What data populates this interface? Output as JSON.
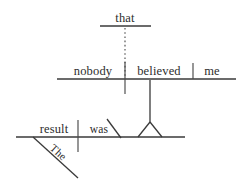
{
  "diagram": {
    "type": "reed-kellogg-sentence-diagram",
    "sentence": "The result was that nobody believed me.",
    "canvas": {
      "width": 239,
      "height": 185,
      "background": "#ffffff",
      "ink": "#2d2d2d"
    },
    "levels": {
      "subordinate_clause_top": {
        "name": "relative-marker-level",
        "baseline": {
          "x1": 100,
          "x2": 151,
          "y": 26
        },
        "words": [
          {
            "id": "that",
            "label": "that",
            "x": 125,
            "y": 22,
            "anchor": "middle",
            "role": "subordinating-conjunction"
          }
        ]
      },
      "subordinate_clause_main": {
        "name": "noun-clause-level",
        "baseline": {
          "x1": 57,
          "x2": 236,
          "y": 79
        },
        "words": [
          {
            "id": "nobody",
            "label": "nobody",
            "x": 93,
            "y": 75,
            "anchor": "middle",
            "role": "subject"
          },
          {
            "id": "believed",
            "label": "believed",
            "x": 159,
            "y": 75,
            "anchor": "middle",
            "role": "verb"
          },
          {
            "id": "me",
            "label": "me",
            "x": 211,
            "y": 75,
            "anchor": "middle",
            "role": "direct-object"
          }
        ],
        "dividers": [
          {
            "id": "subject-verb-divider",
            "x": 125,
            "y1": 62,
            "y2": 94,
            "kind": "full-cross"
          },
          {
            "id": "verb-object-divider",
            "x": 193,
            "y1": 63,
            "y2": 79,
            "kind": "half"
          }
        ]
      },
      "independent_clause": {
        "name": "main-clause-level",
        "baseline": {
          "x1": 16,
          "x2": 185,
          "y": 137
        },
        "words": [
          {
            "id": "result",
            "label": "result",
            "x": 54,
            "y": 133,
            "anchor": "middle",
            "role": "subject"
          },
          {
            "id": "was",
            "label": "was",
            "x": 98,
            "y": 133,
            "anchor": "middle",
            "role": "linking-verb"
          },
          {
            "id": "The",
            "label": "The",
            "x": 50,
            "y": 156,
            "anchor": "middle",
            "role": "article-modifier",
            "rotated": true,
            "rotation_deg": 42
          }
        ],
        "dividers": [
          {
            "id": "subject-verb-divider",
            "x": 78,
            "y1": 120,
            "y2": 152,
            "kind": "full-cross"
          }
        ],
        "modifier_lines": [
          {
            "id": "the-modifier-slant",
            "x1": 33,
            "y1": 137,
            "x2": 78,
            "y2": 178,
            "kind": "diagonal"
          }
        ],
        "complement_marker": {
          "id": "predicate-nominative-backslash",
          "x1": 107,
          "y1": 119,
          "x2": 121,
          "y2": 138,
          "kind": "backslash"
        }
      }
    },
    "connectors": [
      {
        "id": "dotted-relative-connector",
        "kind": "dotted-vertical",
        "from": "that-baseline",
        "to": "noun-clause-baseline",
        "x": 125,
        "y1": 27,
        "y2": 79
      },
      {
        "id": "clause-stem-connector",
        "kind": "solid-vertical",
        "from": "believed-verb",
        "to": "tripod-apex",
        "x": 150,
        "y1": 80,
        "y2": 122
      },
      {
        "id": "tripod-support",
        "kind": "triangle-legs",
        "apex_x": 150,
        "apex_y": 122,
        "left_x": 138,
        "right_x": 162,
        "base_y": 137
      }
    ]
  }
}
